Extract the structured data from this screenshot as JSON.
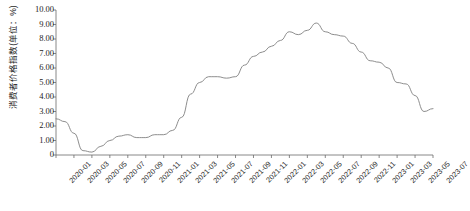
{
  "chart_data": {
    "type": "line",
    "title": "",
    "xlabel": "",
    "ylabel": "消费者价格指数(单位：%)",
    "ylim": [
      0,
      10
    ],
    "ytick_labels": [
      "10.00",
      "9.00",
      "8.00",
      "7.00",
      "6.00",
      "5.00",
      "4.00",
      "3.00",
      "2.00",
      "1.00",
      "0"
    ],
    "ytick_values": [
      10,
      9,
      8,
      7,
      6,
      5,
      4,
      3,
      2,
      1,
      0
    ],
    "xtick_labels": [
      "2020-01",
      "2020-03",
      "2020-05",
      "2020-07",
      "2020-09",
      "2020-11",
      "2021-01",
      "2021-03",
      "2021-05",
      "2021-07",
      "2021-09",
      "2021-11",
      "2022-01",
      "2022-03",
      "2022-05",
      "2022-07",
      "2022-09",
      "2022-11",
      "2023-01",
      "2023-03",
      "2023-05",
      "2023-07"
    ],
    "grid": false,
    "legend": false,
    "line_color": "#808080",
    "series": [
      {
        "name": "消费者价格指数",
        "x": [
          "2020-01",
          "2020-02",
          "2020-03",
          "2020-04",
          "2020-05",
          "2020-06",
          "2020-07",
          "2020-08",
          "2020-09",
          "2020-10",
          "2020-11",
          "2020-12",
          "2021-01",
          "2021-02",
          "2021-03",
          "2021-04",
          "2021-05",
          "2021-06",
          "2021-07",
          "2021-08",
          "2021-09",
          "2021-10",
          "2021-11",
          "2021-12",
          "2022-01",
          "2022-02",
          "2022-03",
          "2022-04",
          "2022-05",
          "2022-06",
          "2022-07",
          "2022-08",
          "2022-09",
          "2022-10",
          "2022-11",
          "2022-12",
          "2023-01",
          "2023-02",
          "2023-03",
          "2023-04",
          "2023-05",
          "2023-06",
          "2023-07"
        ],
        "values": [
          2.5,
          2.3,
          1.5,
          0.3,
          0.2,
          0.6,
          1.0,
          1.3,
          1.4,
          1.2,
          1.2,
          1.4,
          1.4,
          1.7,
          2.6,
          4.2,
          5.0,
          5.4,
          5.4,
          5.3,
          5.4,
          6.2,
          6.8,
          7.1,
          7.5,
          7.9,
          8.5,
          8.3,
          8.6,
          9.1,
          8.5,
          8.3,
          8.2,
          7.7,
          7.1,
          6.5,
          6.4,
          6.0,
          5.0,
          4.9,
          4.1,
          3.0,
          3.2
        ]
      }
    ]
  }
}
